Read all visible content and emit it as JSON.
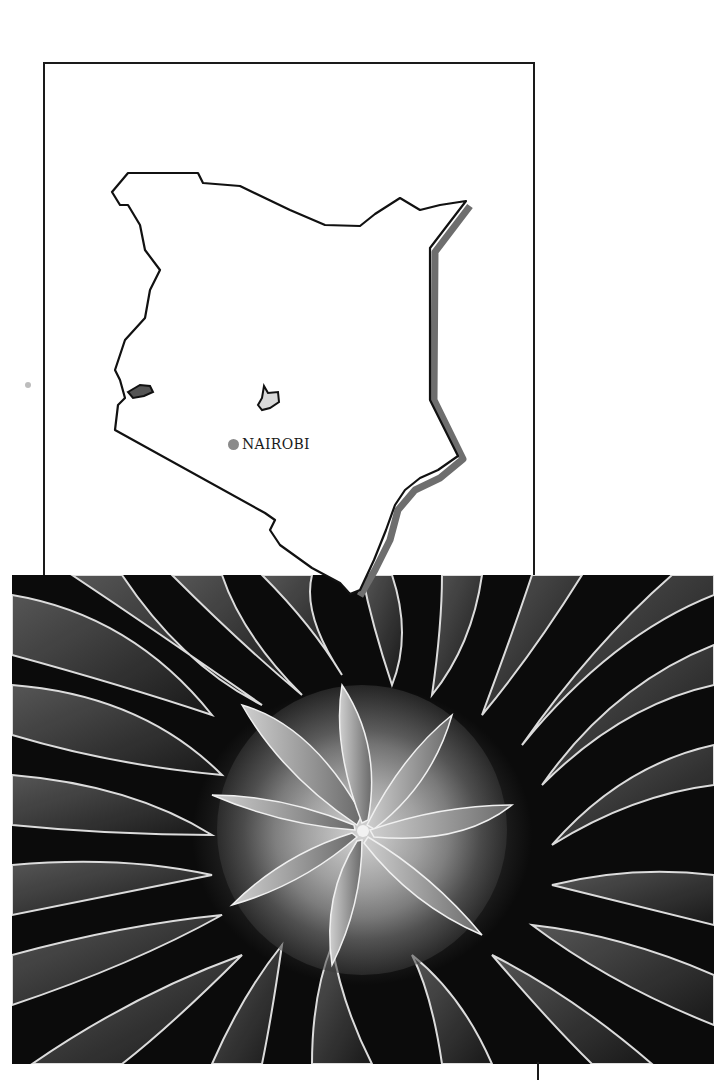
{
  "page": {
    "type": "printed-page",
    "background": "#ffffff"
  },
  "map": {
    "country": "Kenya",
    "frame_color": "#1a1a1a",
    "coast_shadow_color": "#6e6e6e",
    "features": [
      {
        "name": "Lake Victoria (Kenyan portion)",
        "fill": "#555555"
      },
      {
        "name": "Mount Kenya area",
        "fill": "#d9d9d9"
      }
    ],
    "city_label": "NAIROBI",
    "city_dot_color": "#8a8a8a"
  },
  "photo": {
    "subject": "Giant lobelia rosette (black and white close-up)",
    "tone": "grayscale"
  }
}
